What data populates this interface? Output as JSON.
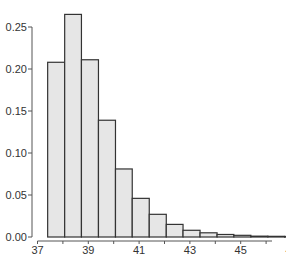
{
  "chart_data": {
    "type": "bar",
    "title": "",
    "xlabel": "",
    "ylabel": "",
    "bin_width": 0.6667,
    "bin_edges": [
      37.4,
      38.07,
      38.73,
      39.4,
      40.07,
      40.73,
      41.4,
      42.07,
      42.73,
      43.4,
      44.07,
      44.73,
      45.4,
      46.07,
      46.73,
      47.4,
      48.07,
      48.73,
      49.4,
      50.07
    ],
    "values": [
      0.208,
      0.265,
      0.211,
      0.139,
      0.081,
      0.046,
      0.027,
      0.015,
      0.008,
      0.005,
      0.003,
      0.002,
      0.001,
      0.0008,
      0.0006
    ],
    "xlim": [
      37,
      50.5
    ],
    "ylim": [
      0,
      0.27
    ],
    "x_ticks": [
      37,
      38,
      39,
      40,
      41,
      42,
      43,
      44,
      45,
      46,
      47,
      48,
      49
    ],
    "x_tick_labels": [
      "37",
      "39",
      "41",
      "43",
      "45",
      "47",
      "49"
    ],
    "y_ticks": [
      0.0,
      0.05,
      0.1,
      0.15,
      0.2,
      0.25
    ],
    "y_tick_labels": [
      "0.00",
      "0.05",
      "0.10",
      "0.15",
      "0.20",
      "0.25"
    ],
    "grid": false,
    "legend": null,
    "colors": {
      "bar_fill": "#e6e6e6",
      "bar_edge": "#333333",
      "axis": "#555555"
    }
  }
}
